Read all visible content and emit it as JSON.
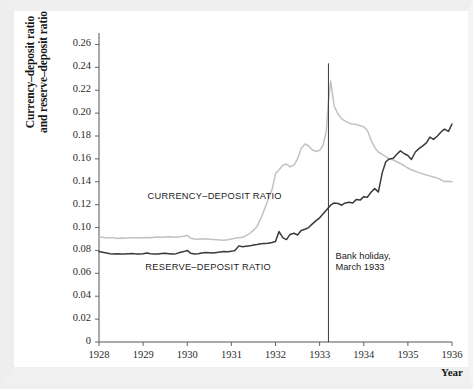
{
  "chart_data": {
    "type": "line",
    "title": "",
    "xlabel": "Year",
    "ylabel": "Currency–deposit ratio and reserve–deposit ratio",
    "ylabel_lines": [
      "Currency–deposit ratio",
      "and reserve–deposit ratio"
    ],
    "xlim": [
      1928,
      1936
    ],
    "ylim": [
      0,
      0.27
    ],
    "grid": false,
    "legend_position": "inline-labels",
    "xticks": [
      1928,
      1929,
      1930,
      1931,
      1932,
      1933,
      1934,
      1935,
      1936
    ],
    "xtick_labels": [
      "1928",
      "1929",
      "1930",
      "1931",
      "1932",
      "1933",
      "1934",
      "1935",
      "1936"
    ],
    "yticks": [
      0,
      0.02,
      0.04,
      0.06,
      0.08,
      0.1,
      0.12,
      0.14,
      0.16,
      0.18,
      0.2,
      0.22,
      0.24,
      0.26
    ],
    "ytick_labels": [
      "0",
      "0.02",
      "0.04",
      "0.06",
      "0.08",
      "0.10",
      "0.12",
      "0.14",
      "0.16",
      "0.18",
      "0.20",
      "0.22",
      "0.24",
      "0.26"
    ],
    "annotations": [
      {
        "name": "bank-holiday",
        "text_lines": [
          "Bank holiday,",
          "March 1933"
        ],
        "x": 1933.2,
        "type": "vline-with-text"
      }
    ],
    "series": [
      {
        "name": "CURRENCY–DEPOSIT RATIO",
        "color": "#c2c2c2",
        "label_x": 1929.1,
        "label_y": 0.1265,
        "x": [
          1928.0,
          1928.08,
          1928.17,
          1928.25,
          1928.33,
          1928.42,
          1928.5,
          1928.58,
          1928.67,
          1928.75,
          1928.83,
          1928.92,
          1929.0,
          1929.08,
          1929.17,
          1929.25,
          1929.33,
          1929.42,
          1929.5,
          1929.58,
          1929.67,
          1929.75,
          1929.83,
          1929.92,
          1930.0,
          1930.08,
          1930.17,
          1930.25,
          1930.33,
          1930.42,
          1930.5,
          1930.58,
          1930.67,
          1930.75,
          1930.83,
          1930.92,
          1931.0,
          1931.08,
          1931.17,
          1931.25,
          1931.33,
          1931.42,
          1931.5,
          1931.58,
          1931.67,
          1931.75,
          1931.83,
          1931.92,
          1932.0,
          1932.08,
          1932.17,
          1932.25,
          1932.33,
          1932.42,
          1932.5,
          1932.58,
          1932.67,
          1932.75,
          1932.83,
          1932.92,
          1933.0,
          1933.08,
          1933.15,
          1933.2,
          1933.25,
          1933.33,
          1933.42,
          1933.5,
          1933.58,
          1933.67,
          1933.75,
          1933.83,
          1933.92,
          1934.0,
          1934.08,
          1934.17,
          1934.25,
          1934.33,
          1934.42,
          1934.5,
          1934.58,
          1934.67,
          1934.75,
          1934.83,
          1934.92,
          1935.0,
          1935.08,
          1935.17,
          1935.25,
          1935.33,
          1935.42,
          1935.5,
          1935.58,
          1935.67,
          1935.75,
          1935.83,
          1935.92,
          1936.0
        ],
        "y": [
          0.092,
          0.0915,
          0.0908,
          0.0912,
          0.091,
          0.0905,
          0.0908,
          0.0906,
          0.091,
          0.0912,
          0.0908,
          0.091,
          0.0912,
          0.0914,
          0.091,
          0.0916,
          0.0918,
          0.0915,
          0.0918,
          0.092,
          0.0918,
          0.0916,
          0.092,
          0.0924,
          0.0932,
          0.0906,
          0.09,
          0.0898,
          0.0902,
          0.09,
          0.0898,
          0.0896,
          0.0894,
          0.0892,
          0.089,
          0.0894,
          0.09,
          0.0906,
          0.091,
          0.0915,
          0.093,
          0.095,
          0.0975,
          0.101,
          0.108,
          0.116,
          0.124,
          0.133,
          0.147,
          0.1505,
          0.1545,
          0.1555,
          0.153,
          0.1545,
          0.16,
          0.169,
          0.173,
          0.1715,
          0.168,
          0.1665,
          0.1675,
          0.172,
          0.184,
          0.21,
          0.228,
          0.206,
          0.199,
          0.195,
          0.193,
          0.1912,
          0.1905,
          0.19,
          0.189,
          0.188,
          0.185,
          0.176,
          0.17,
          0.166,
          0.164,
          0.162,
          0.16,
          0.159,
          0.1575,
          0.156,
          0.154,
          0.152,
          0.1505,
          0.1492,
          0.148,
          0.147,
          0.146,
          0.145,
          0.1442,
          0.1432,
          0.1418,
          0.1402,
          0.1405,
          0.14
        ]
      },
      {
        "name": "RESERVE–DEPOSIT RATIO",
        "color": "#3a3a3a",
        "label_x": 1929.05,
        "label_y": 0.0645,
        "x": [
          1928.0,
          1928.08,
          1928.17,
          1928.25,
          1928.33,
          1928.42,
          1928.5,
          1928.58,
          1928.67,
          1928.75,
          1928.83,
          1928.92,
          1929.0,
          1929.08,
          1929.17,
          1929.25,
          1929.33,
          1929.42,
          1929.5,
          1929.58,
          1929.67,
          1929.75,
          1929.83,
          1929.92,
          1930.0,
          1930.08,
          1930.17,
          1930.25,
          1930.33,
          1930.42,
          1930.5,
          1930.58,
          1930.67,
          1930.75,
          1930.83,
          1930.92,
          1931.0,
          1931.08,
          1931.17,
          1931.25,
          1931.33,
          1931.42,
          1931.5,
          1931.58,
          1931.67,
          1931.75,
          1931.83,
          1931.92,
          1932.0,
          1932.08,
          1932.17,
          1932.25,
          1932.33,
          1932.42,
          1932.5,
          1932.58,
          1932.67,
          1932.75,
          1932.83,
          1932.92,
          1933.0,
          1933.08,
          1933.17,
          1933.25,
          1933.33,
          1933.42,
          1933.5,
          1933.58,
          1933.67,
          1933.75,
          1933.83,
          1933.92,
          1934.0,
          1934.08,
          1934.17,
          1934.25,
          1934.33,
          1934.42,
          1934.5,
          1934.58,
          1934.67,
          1934.75,
          1934.83,
          1934.92,
          1935.0,
          1935.08,
          1935.17,
          1935.25,
          1935.33,
          1935.42,
          1935.5,
          1935.58,
          1935.67,
          1935.75,
          1935.83,
          1935.92,
          1936.0
        ],
        "y": [
          0.079,
          0.0785,
          0.0778,
          0.0772,
          0.0768,
          0.0772,
          0.077,
          0.0768,
          0.0772,
          0.0774,
          0.077,
          0.0768,
          0.0772,
          0.0778,
          0.0772,
          0.0768,
          0.077,
          0.0774,
          0.0776,
          0.0772,
          0.0768,
          0.0772,
          0.0782,
          0.079,
          0.08,
          0.0775,
          0.0768,
          0.0772,
          0.0778,
          0.0782,
          0.078,
          0.0778,
          0.0782,
          0.0786,
          0.079,
          0.0788,
          0.0792,
          0.08,
          0.084,
          0.0832,
          0.0836,
          0.084,
          0.0848,
          0.0852,
          0.0858,
          0.086,
          0.0862,
          0.087,
          0.0878,
          0.0965,
          0.091,
          0.0895,
          0.094,
          0.095,
          0.0935,
          0.0975,
          0.0985,
          0.1,
          0.103,
          0.106,
          0.1085,
          0.112,
          0.116,
          0.1195,
          0.1215,
          0.121,
          0.1195,
          0.1215,
          0.1222,
          0.1215,
          0.1245,
          0.124,
          0.127,
          0.1265,
          0.131,
          0.134,
          0.131,
          0.148,
          0.1575,
          0.16,
          0.1605,
          0.164,
          0.167,
          0.1645,
          0.163,
          0.1595,
          0.166,
          0.169,
          0.1712,
          0.174,
          0.179,
          0.177,
          0.18,
          0.1835,
          0.186,
          0.184,
          0.1905
        ]
      }
    ]
  }
}
